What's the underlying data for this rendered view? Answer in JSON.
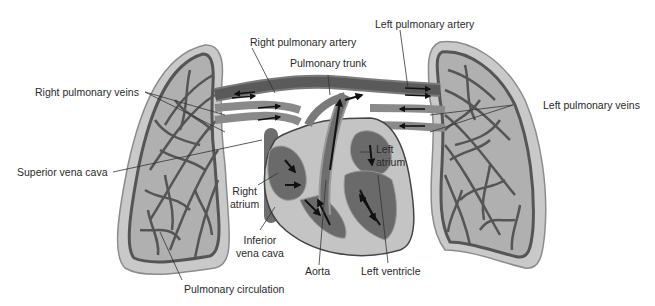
{
  "diagram": {
    "title": "Pulmonary circulation",
    "colors": {
      "background": "#ffffff",
      "lung_outer": "#c9c9c9",
      "lung_edge": "#8c8c8c",
      "vessel": "#5a5a5a",
      "vessel_dark": "#3e3e3e",
      "vessel_light": "#a8a8a8",
      "heart_wall": "#b5b5b5",
      "chamber": "#6a6a6a",
      "arrow": "#111111",
      "leader_line": "#333333",
      "text": "#2a2a2a"
    },
    "labels": {
      "right_pulmonary_artery": "Right pulmonary artery",
      "pulmonary_trunk": "Pulmonary trunk",
      "left_pulmonary_artery": "Left pulmonary artery",
      "right_pulmonary_veins": "Right pulmonary veins",
      "left_pulmonary_veins": "Left pulmonary veins",
      "superior_vena_cava": "Superior vena cava",
      "left_atrium_line1": "Left",
      "left_atrium_line2": "atrium",
      "right_atrium_line1": "Right",
      "right_atrium_line2": "atrium",
      "inferior_vena_cava_line1": "Inferior",
      "inferior_vena_cava_line2": "vena cava",
      "aorta": "Aorta",
      "left_ventricle": "Left ventricle",
      "pulmonary_circulation": "Pulmonary circulation"
    }
  }
}
